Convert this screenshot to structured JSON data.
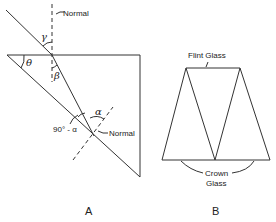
{
  "figure_a": {
    "panel_label": "A",
    "normal_top_label": "Normal",
    "normal_bottom_label": "Normal",
    "angle_gamma": "γ",
    "angle_theta": "θ",
    "angle_beta": "β",
    "angle_alpha_top": "α",
    "angle_ninety_minus_alpha": "90° - α"
  },
  "figure_b": {
    "panel_label": "B",
    "flint_label": "Flint Glass",
    "crown_label_line1": "Crown",
    "crown_label_line2": "Glass"
  },
  "colors": {
    "line": "#333333",
    "background": "#ffffff"
  }
}
